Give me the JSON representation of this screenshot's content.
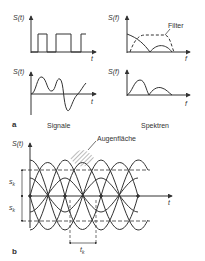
{
  "panel_a": {
    "label": "a",
    "signals": {
      "caption": "Signale",
      "top": {
        "y_axis": "S(t)",
        "x_axis": "t",
        "type": "rectangular pulse train"
      },
      "bottom": {
        "y_axis": "S(t)",
        "x_axis": "t",
        "type": "band-limited waveform"
      }
    },
    "spectra": {
      "caption": "Spektren",
      "top": {
        "y_axis": "S(f)",
        "x_axis": "f",
        "annotation": "Filter"
      },
      "bottom": {
        "y_axis": "S(f)",
        "x_axis": "f"
      }
    }
  },
  "panel_b": {
    "label": "b",
    "y_axis": "S(t)",
    "x_axis": "t",
    "annotation": "Augenfläche",
    "level_upper": "s",
    "level_upper_sub": "k",
    "level_lower": "s",
    "level_lower_sub": "k",
    "period": "t",
    "period_sub": "k"
  },
  "colors": {
    "line": "#333333",
    "hatch": "#555555",
    "background": "#ffffff"
  }
}
